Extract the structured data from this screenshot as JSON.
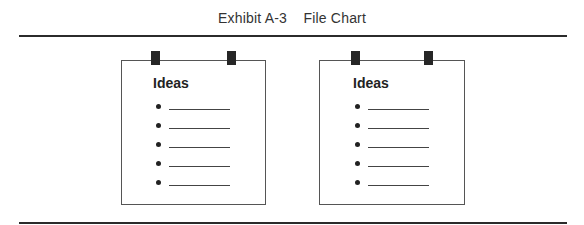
{
  "exhibit": {
    "label": "Exhibit A-3",
    "title": "File Chart",
    "full_title": "Exhibit A-3    File Chart"
  },
  "cards": [
    {
      "heading": "Ideas",
      "items": [
        "",
        "",
        "",
        "",
        ""
      ]
    },
    {
      "heading": "Ideas",
      "items": [
        "",
        "",
        "",
        "",
        ""
      ]
    }
  ],
  "colors": {
    "rule": "#2b2b2b",
    "clip": "#262626",
    "card_border": "#555555",
    "text": "#222222"
  }
}
